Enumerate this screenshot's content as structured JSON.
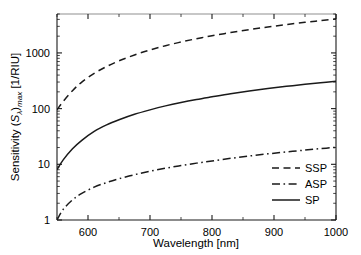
{
  "chart_data": {
    "type": "line",
    "title": "",
    "xlabel": "Wavelength [nm]",
    "ylabel": "Sensitivity (Sλ)max [1/RIU]",
    "ylabel_parts": {
      "prefix": "Sensitivity (",
      "symbol": "S",
      "symbol_sub": "λ",
      "mid": ")",
      "post_sub": "max",
      "suffix": " [1/RIU]"
    },
    "xscale": "linear",
    "yscale": "log",
    "xlim": [
      550,
      1000
    ],
    "ylim": [
      1,
      5000
    ],
    "xticks": [
      600,
      700,
      800,
      900,
      1000
    ],
    "xticklabels": [
      "600",
      "700",
      "800",
      "900",
      "1000"
    ],
    "yticks": [
      1,
      10,
      100,
      1000
    ],
    "yticklabels": [
      "1",
      "10",
      "100",
      "1000"
    ],
    "grid": false,
    "legend_position": "lower-right",
    "frame_color": "#1a1a1a",
    "frame_top_color": "#b4b4b4",
    "series": [
      {
        "name": "SSP",
        "style": "dashed",
        "color": "#1a1a1a",
        "x": [
          550,
          560,
          575,
          590,
          610,
          630,
          650,
          675,
          700,
          725,
          750,
          775,
          800,
          830,
          860,
          890,
          920,
          950,
          975,
          1000
        ],
        "y": [
          95,
          135,
          210,
          300,
          430,
          570,
          720,
          920,
          1130,
          1350,
          1570,
          1800,
          2030,
          2320,
          2620,
          2920,
          3230,
          3540,
          3800,
          4100
        ]
      },
      {
        "name": "ASP",
        "style": "dashdot",
        "color": "#1a1a1a",
        "x": [
          550,
          560,
          575,
          590,
          610,
          630,
          650,
          675,
          700,
          725,
          750,
          775,
          800,
          830,
          860,
          890,
          920,
          950,
          975,
          1000
        ],
        "y": [
          1.0,
          1.55,
          2.3,
          3.0,
          3.9,
          4.7,
          5.5,
          6.5,
          7.5,
          8.5,
          9.5,
          10.5,
          11.5,
          12.8,
          14.1,
          15.4,
          16.7,
          18.0,
          19.1,
          20.2
        ]
      },
      {
        "name": "SP",
        "style": "solid",
        "color": "#1a1a1a",
        "x": [
          550,
          560,
          575,
          590,
          610,
          630,
          650,
          675,
          700,
          725,
          750,
          775,
          800,
          830,
          860,
          890,
          920,
          950,
          975,
          1000
        ],
        "y": [
          8.0,
          12.0,
          19.0,
          27.0,
          39.0,
          51.0,
          63.0,
          79.0,
          95.0,
          112.0,
          129.0,
          146.0,
          163.0,
          185.0,
          207.0,
          229.0,
          251.0,
          273.0,
          291.0,
          309.0
        ]
      }
    ]
  },
  "legend": {
    "entries": [
      {
        "label": "SSP",
        "style": "dashed"
      },
      {
        "label": "ASP",
        "style": "dashdot"
      },
      {
        "label": "SP",
        "style": "solid"
      }
    ]
  }
}
